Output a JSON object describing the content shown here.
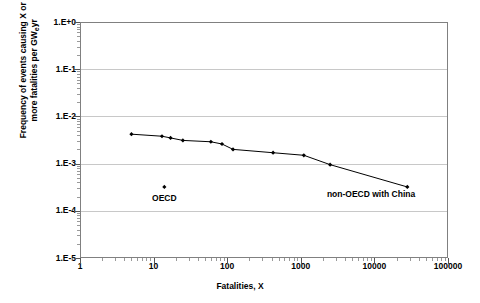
{
  "chart_data": {
    "type": "line",
    "title": "",
    "xlabel": "Fatalities, X",
    "ylabel": "Frequency of events causing X or more fatalities per GWeyr",
    "ylabel_line1": "Frequency of events causing X or",
    "ylabel_line2_pre": "more fatalities per GW",
    "ylabel_line2_sub": "e",
    "ylabel_line2_post": "yr",
    "xscale": "log",
    "yscale": "log",
    "xlim": [
      1,
      100000
    ],
    "ylim": [
      1e-05,
      1
    ],
    "grid": "horizontal",
    "legend": "none",
    "xticks": [
      "1",
      "10",
      "100",
      "1000",
      "10000",
      "100000"
    ],
    "xtick_values": [
      1,
      10,
      100,
      1000,
      10000,
      100000
    ],
    "yticks": [
      "1.E+0",
      "1.E-1",
      "1.E-2",
      "1.E-3",
      "1.E-4",
      "1.E-5"
    ],
    "ytick_values": [
      1,
      0.1,
      0.01,
      0.001,
      0.0001,
      1e-05
    ],
    "series": [
      {
        "name": "non-OECD with China",
        "marker": "filled-diamond",
        "x": [
          5,
          13,
          17,
          25,
          60,
          85,
          120,
          420,
          1100,
          2500,
          28000
        ],
        "y": [
          0.0042,
          0.0038,
          0.0035,
          0.0031,
          0.0029,
          0.0026,
          0.002,
          0.0017,
          0.0015,
          0.00095,
          0.00032
        ]
      },
      {
        "name": "OECD",
        "marker": "filled-diamond",
        "x": [
          14
        ],
        "y": [
          0.00032
        ]
      }
    ],
    "annotations": [
      {
        "text": "OECD",
        "x": 14,
        "y": 0.00019
      },
      {
        "text": "non-OECD with China",
        "x": 9000,
        "y": 0.00023
      }
    ]
  }
}
